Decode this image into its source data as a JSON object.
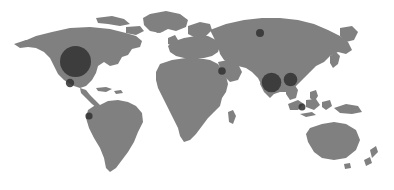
{
  "figure": {
    "type": "world-map-bubble-chart",
    "title": "",
    "width": 394,
    "height": 190,
    "background_color": "#ffffff"
  },
  "map": {
    "name": "world-basemap",
    "projection": "equirectangular",
    "land_color": "#808080",
    "ocean_color": "#ffffff",
    "graticule": false,
    "borders": false
  },
  "chart_data": {
    "type": "scatter",
    "subtype": "proportional-symbol-map",
    "title": "",
    "xlabel": "",
    "ylabel": "",
    "legend_position": "none",
    "grid": false,
    "marker_color": "#333333",
    "marker_opacity": 0.88,
    "size_encoding": "radius",
    "points": [
      {
        "id": "bubble-north-america",
        "label": "North America",
        "x": 75.5,
        "y": 61.5,
        "r": 15.5,
        "rank": 1,
        "relative_size": 1.0
      },
      {
        "id": "bubble-south-asia",
        "label": "South Asia",
        "x": 271.5,
        "y": 82.5,
        "r": 9.8,
        "rank": 2,
        "relative_size": 0.63
      },
      {
        "id": "bubble-east-asia",
        "label": "East Asia",
        "x": 290.5,
        "y": 79.5,
        "r": 6.8,
        "rank": 3,
        "relative_size": 0.44
      },
      {
        "id": "bubble-mexico",
        "label": "Mexico",
        "x": 70.0,
        "y": 83.0,
        "r": 4.2,
        "rank": 4,
        "relative_size": 0.27
      },
      {
        "id": "bubble-north-asia",
        "label": "North Asia",
        "x": 260.0,
        "y": 33.0,
        "r": 4.0,
        "rank": 5,
        "relative_size": 0.26
      },
      {
        "id": "bubble-middle-east",
        "label": "Middle East",
        "x": 222.0,
        "y": 71.0,
        "r": 3.8,
        "rank": 6,
        "relative_size": 0.25
      },
      {
        "id": "bubble-south-america",
        "label": "South America",
        "x": 89.0,
        "y": 116.0,
        "r": 3.6,
        "rank": 7,
        "relative_size": 0.23
      },
      {
        "id": "bubble-southeast-asia",
        "label": "Southeast Asia",
        "x": 302.0,
        "y": 107.0,
        "r": 3.5,
        "rank": 8,
        "relative_size": 0.22
      }
    ]
  }
}
